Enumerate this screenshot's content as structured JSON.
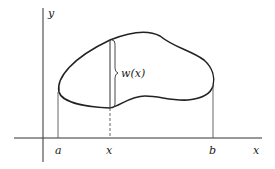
{
  "diagram": {
    "axes": {
      "x_label": "x",
      "y_label": "y"
    },
    "labels": {
      "a": "a",
      "b": "b",
      "x": "x",
      "width": "w(x)"
    },
    "colors": {
      "stroke": "#222222",
      "background": "#ffffff"
    }
  }
}
